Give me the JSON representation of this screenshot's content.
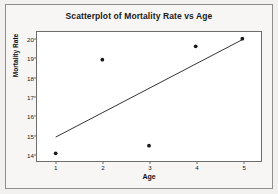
{
  "chart_data": {
    "type": "scatter",
    "title": "Scatterplot of Mortality Rate vs Age",
    "xlabel": "Age",
    "ylabel": "Mortality Rate",
    "x": [
      1,
      2,
      3,
      4,
      5
    ],
    "values": [
      14.0,
      18.9,
      14.4,
      19.6,
      20.0
    ],
    "series": [
      {
        "name": "Mortality Rate",
        "points": [
          {
            "x": 1,
            "y": 14.0
          },
          {
            "x": 2,
            "y": 18.9
          },
          {
            "x": 3,
            "y": 14.4
          },
          {
            "x": 4,
            "y": 19.6
          },
          {
            "x": 5,
            "y": 20.0
          }
        ],
        "marker": "filled-circle",
        "color": "#1a1a1a"
      }
    ],
    "trendline": {
      "name": "fitted-line",
      "x_start": 1,
      "y_start": 14.85,
      "x_end": 5,
      "y_end": 19.95,
      "color": "#1a1a1a"
    },
    "xlim": [
      0.6,
      5.4
    ],
    "ylim": [
      13.6,
      20.35
    ],
    "xticks": [
      "1",
      "2",
      "3",
      "4",
      "5"
    ],
    "xtick_values": [
      1,
      2,
      3,
      4,
      5
    ],
    "yticks": [
      "14",
      "15",
      "16",
      "17",
      "18",
      "19",
      "20"
    ],
    "ytick_values": [
      14,
      15,
      16,
      17,
      18,
      19,
      20
    ],
    "grid": false,
    "legend": false,
    "plot_background": "#ffffff",
    "frame_background": "#f7f6f4",
    "axis_color": "#6d6d6d"
  }
}
